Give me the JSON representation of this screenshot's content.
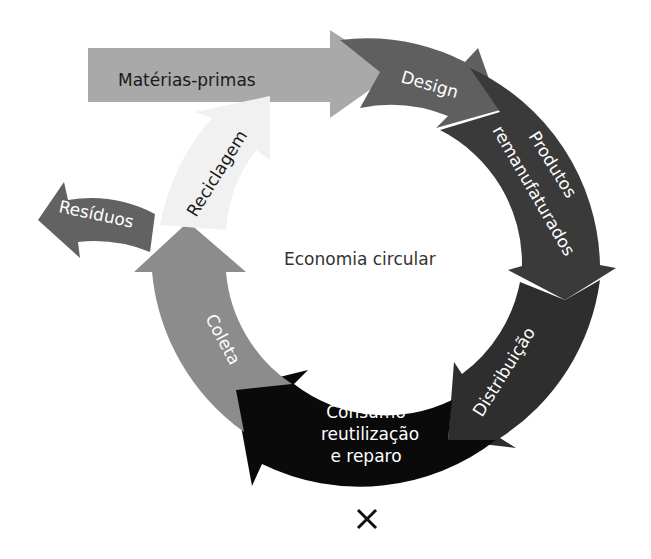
{
  "diagram": {
    "title": "Economia circular",
    "input_arrow": {
      "label": "Matérias-primas",
      "color": "#a9a9a9"
    },
    "stages": [
      {
        "id": "design",
        "label": "Design",
        "color": "#5f5f5f"
      },
      {
        "id": "produtos",
        "label_line1": "Produtos",
        "label_line2": "remanufaturados",
        "color": "#3a3a3a"
      },
      {
        "id": "distribuicao",
        "label": "Distribuição",
        "color": "#2e2e2e"
      },
      {
        "id": "consumo",
        "label_line1": "Consumo",
        "label_line2": "reutilização",
        "label_line3": "e reparo",
        "color": "#0a0a0a"
      },
      {
        "id": "coleta",
        "label": "Coleta",
        "color": "#8c8c8c"
      },
      {
        "id": "reciclagem",
        "label": "Reciclagem",
        "color": "#f2f2f2"
      }
    ],
    "output_arrow": {
      "label": "Resíduos",
      "color": "#626262"
    }
  },
  "controls": {
    "close_icon": "close-icon"
  }
}
